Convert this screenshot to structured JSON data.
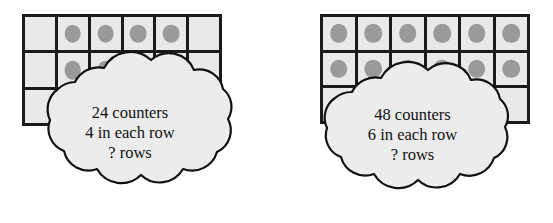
{
  "page": {
    "background_color": "#ffffff"
  },
  "style": {
    "grid_border_color": "#1a1a1a",
    "cell_fill_color": "#e9e9e9",
    "counter_color": "#9a9a9a",
    "cloud_fill_color": "#ececec",
    "cloud_outline_color": "#111111",
    "text_color": "#111111"
  },
  "problems": [
    {
      "id": "problem-left",
      "grid": {
        "columns": 6,
        "rows": 3,
        "counters_per_row": 4,
        "filled_cells_row1": [
          false,
          true,
          true,
          true,
          true,
          false
        ],
        "filled_cells_row2": [
          false,
          true,
          true,
          true,
          true,
          false
        ],
        "filled_cells_row3": [
          false,
          false,
          false,
          false,
          false,
          false
        ]
      },
      "cloud": {
        "line1": "24 counters",
        "line2": "4 in each row",
        "line3": "? rows"
      },
      "values": {
        "total_counters": 24,
        "in_each_row": 4,
        "rows": "?"
      }
    },
    {
      "id": "problem-right",
      "grid": {
        "columns": 6,
        "rows": 3,
        "counters_per_row": 6,
        "filled_cells_row1": [
          true,
          true,
          true,
          true,
          true,
          true
        ],
        "filled_cells_row2": [
          true,
          true,
          true,
          true,
          true,
          true
        ],
        "filled_cells_row3": [
          false,
          false,
          false,
          false,
          false,
          false
        ]
      },
      "cloud": {
        "line1": "48 counters",
        "line2": "6 in each row",
        "line3": "? rows"
      },
      "values": {
        "total_counters": 48,
        "in_each_row": 6,
        "rows": "?"
      }
    }
  ]
}
